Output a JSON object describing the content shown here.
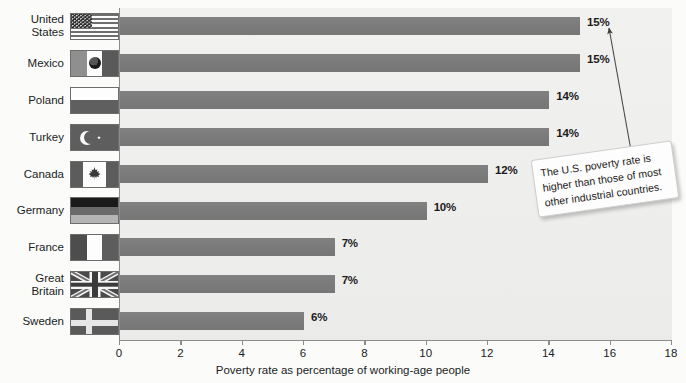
{
  "chart_data": {
    "type": "bar",
    "orientation": "horizontal",
    "title": "",
    "xlabel": "Poverty rate as percentage of working-age people",
    "ylabel": "",
    "xlim": [
      0,
      18
    ],
    "xticks": [
      0,
      2,
      4,
      6,
      8,
      10,
      12,
      14,
      16,
      18
    ],
    "grid": false,
    "legend": null,
    "categories": [
      "United\nStates",
      "Mexico",
      "Poland",
      "Turkey",
      "Canada",
      "Germany",
      "France",
      "Great Britain",
      "Sweden"
    ],
    "values": [
      15,
      15,
      14,
      14,
      12,
      10,
      7,
      7,
      6
    ],
    "data_labels": [
      "15%",
      "15%",
      "14%",
      "14%",
      "12%",
      "10%",
      "7%",
      "7%",
      "6%"
    ],
    "series": [
      {
        "name": "Poverty rate",
        "values": [
          15,
          15,
          14,
          14,
          12,
          10,
          7,
          7,
          6
        ]
      }
    ],
    "annotations": [
      {
        "text": "The U.S. poverty rate is higher than those of most other industrial countries.",
        "points_to": "United States (15%)"
      }
    ],
    "colors": {
      "bar": "#7b7b7b",
      "plot_background": "#efefee",
      "page_background": "#fbfbfa",
      "axis": "#8b8b8b",
      "text": "#201d1d"
    }
  },
  "rows": [
    {
      "label": "United\nStates",
      "value": 15,
      "value_label": "15%",
      "flag": "flag-united-states"
    },
    {
      "label": "Mexico",
      "value": 15,
      "value_label": "15%",
      "flag": "flag-mexico"
    },
    {
      "label": "Poland",
      "value": 14,
      "value_label": "14%",
      "flag": "flag-poland"
    },
    {
      "label": "Turkey",
      "value": 14,
      "value_label": "14%",
      "flag": "flag-turkey"
    },
    {
      "label": "Canada",
      "value": 12,
      "value_label": "12%",
      "flag": "flag-canada"
    },
    {
      "label": "Germany",
      "value": 10,
      "value_label": "10%",
      "flag": "flag-germany"
    },
    {
      "label": "France",
      "value": 7,
      "value_label": "7%",
      "flag": "flag-france"
    },
    {
      "label": "Great Britain",
      "value": 7,
      "value_label": "7%",
      "flag": "flag-great-britain"
    },
    {
      "label": "Sweden",
      "value": 6,
      "value_label": "6%",
      "flag": "flag-sweden"
    }
  ],
  "axis": {
    "ticks": [
      "0",
      "2",
      "4",
      "6",
      "8",
      "10",
      "12",
      "14",
      "16",
      "18"
    ],
    "title": "Poverty rate as percentage of working-age people"
  },
  "callout": {
    "line1": "The U.S. poverty rate is",
    "line2": "higher than those of most",
    "line3": "other industrial countries.",
    "full_text": "The U.S. poverty rate is higher than those of most other industrial countries."
  }
}
